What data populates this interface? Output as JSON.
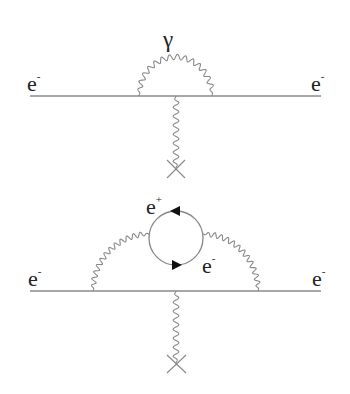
{
  "diagrams": [
    {
      "name": "electron self-energy vertex correction",
      "labels": {
        "incoming": {
          "base": "e",
          "charge": "-"
        },
        "outgoing": {
          "base": "e",
          "charge": "-"
        },
        "photon": "γ"
      }
    },
    {
      "name": "vacuum polarization loop",
      "labels": {
        "incoming": {
          "base": "e",
          "charge": "-"
        },
        "outgoing": {
          "base": "e",
          "charge": "-"
        },
        "loop_positron": {
          "base": "e",
          "charge": "+"
        },
        "loop_electron": {
          "base": "e",
          "charge": "-"
        }
      }
    }
  ],
  "colors": {
    "line": "#8a8a8a",
    "text": "#222222",
    "arrow": "#111111"
  }
}
